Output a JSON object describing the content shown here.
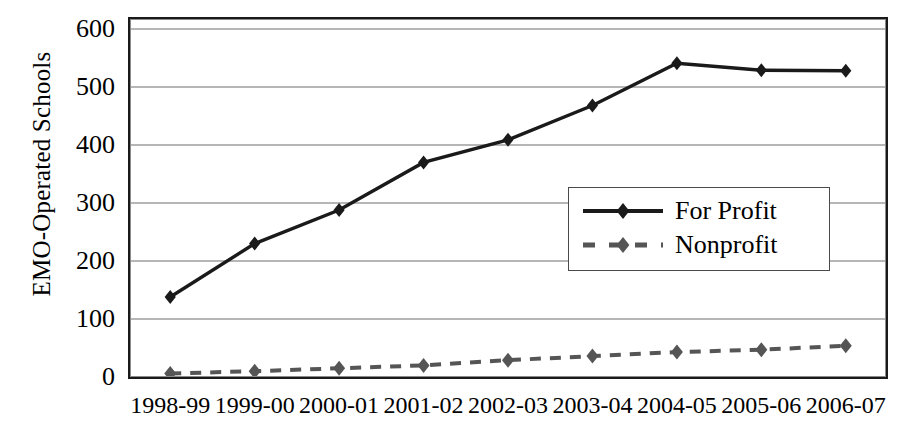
{
  "chart_data": {
    "type": "line",
    "title": "",
    "xlabel": "",
    "ylabel": "EMO-Operated Schools",
    "categories": [
      "1998-99",
      "1999-00",
      "2000-01",
      "2001-02",
      "2002-03",
      "2003-04",
      "2004-05",
      "2005-06",
      "2006-07"
    ],
    "yticks": [
      0,
      100,
      200,
      300,
      400,
      500,
      600
    ],
    "ylim": [
      0,
      600
    ],
    "grid": true,
    "legend_position": "inside-right-middle",
    "series": [
      {
        "name": "For Profit",
        "style": "solid",
        "marker": "diamond",
        "color": "#1a1a1a",
        "values": [
          138,
          230,
          288,
          370,
          409,
          468,
          541,
          529,
          528
        ]
      },
      {
        "name": "Nonprofit",
        "style": "dashed",
        "marker": "diamond",
        "color": "#555555",
        "values": [
          6,
          10,
          15,
          20,
          29,
          36,
          43,
          47,
          54
        ]
      }
    ]
  },
  "legend": {
    "entries": [
      {
        "label": "For Profit"
      },
      {
        "label": "Nonprofit"
      }
    ]
  },
  "colors": {
    "for_profit": "#1a1a1a",
    "nonprofit": "#555555",
    "grid": "#6e6e6e",
    "frame": "#1a1a1a",
    "background": "#ffffff"
  }
}
